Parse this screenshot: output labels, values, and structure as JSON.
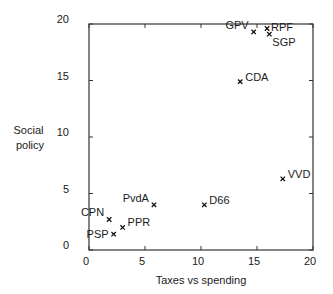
{
  "chart_data": {
    "type": "scatter",
    "title": "",
    "xlabel": "Taxes vs spending",
    "ylabel": "Social policy",
    "ylabel_lines": [
      "Social",
      "policy"
    ],
    "xlim": [
      0,
      20
    ],
    "ylim": [
      0,
      20
    ],
    "xticks": [
      0,
      5,
      10,
      15,
      20
    ],
    "yticks": [
      0,
      5,
      10,
      15,
      20
    ],
    "grid": false,
    "legend": null,
    "marker": "x",
    "points": [
      {
        "label": "CPN",
        "x": 1.8,
        "y": 2.7,
        "label_pos": "left-above"
      },
      {
        "label": "PSP",
        "x": 2.2,
        "y": 1.4,
        "label_pos": "left"
      },
      {
        "label": "PPR",
        "x": 3.0,
        "y": 2.0,
        "label_pos": "right-above"
      },
      {
        "label": "PvdA",
        "x": 5.8,
        "y": 4.0,
        "label_pos": "left-above"
      },
      {
        "label": "D66",
        "x": 10.3,
        "y": 4.0,
        "label_pos": "right-above"
      },
      {
        "label": "CDA",
        "x": 13.5,
        "y": 14.9,
        "label_pos": "right-above"
      },
      {
        "label": "VVD",
        "x": 17.3,
        "y": 6.3,
        "label_pos": "right-above"
      },
      {
        "label": "GPV",
        "x": 14.7,
        "y": 19.3,
        "label_pos": "left-above"
      },
      {
        "label": "RPF",
        "x": 15.9,
        "y": 19.6,
        "label_pos": "right"
      },
      {
        "label": "SGP",
        "x": 16.1,
        "y": 19.1,
        "label_pos": "right-below"
      }
    ]
  }
}
